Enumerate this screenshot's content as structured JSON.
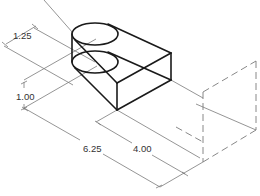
{
  "drawing": {
    "type": "isometric-dimensioned-view",
    "colors": {
      "object": "#1a1a1a",
      "dimension": "#7a7a7a",
      "text": "#333333",
      "background": "#ffffff"
    },
    "dimensions": [
      {
        "id": "dim-radius",
        "label": "1.25"
      },
      {
        "id": "dim-height",
        "label": "1.00"
      },
      {
        "id": "dim-length",
        "label": "6.25"
      },
      {
        "id": "dim-width",
        "label": "4.00"
      }
    ]
  }
}
